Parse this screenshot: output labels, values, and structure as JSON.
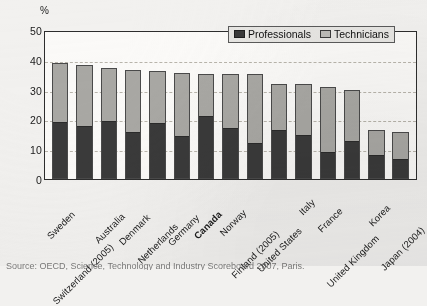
{
  "chart_data": {
    "type": "bar",
    "subtype": "stacked-vertical",
    "title": "",
    "xlabel": "",
    "ylabel": "%",
    "ylim": [
      0,
      50
    ],
    "yticks": [
      0,
      10,
      20,
      30,
      40,
      50
    ],
    "grid": "horizontal-dashed",
    "legend_position": "top-right",
    "categories": [
      "Sweden",
      "Switzerland (2005)",
      "Australia",
      "Denmark",
      "Netherlands",
      "Germany",
      "Canada",
      "Norway",
      "Finland (2005)",
      "United States",
      "Italy",
      "France",
      "United Kingdom",
      "Korea",
      "Japan (2004)"
    ],
    "highlighted_category": "Canada",
    "series": [
      {
        "name": "Professionals",
        "color": "#3a3a3a",
        "values": [
          19.3,
          17.8,
          19.5,
          15.7,
          18.9,
          14.5,
          21.3,
          17.0,
          11.9,
          16.6,
          14.8,
          8.9,
          12.8,
          8.0,
          6.5
        ]
      },
      {
        "name": "Technicians",
        "color": "#a9a8a4",
        "values": [
          19.5,
          20.4,
          17.9,
          20.9,
          17.2,
          21.0,
          14.1,
          18.4,
          23.5,
          15.3,
          17.1,
          21.9,
          17.2,
          8.3,
          9.3
        ]
      }
    ],
    "totals": [
      38.8,
      38.2,
      37.4,
      36.6,
      36.1,
      35.5,
      35.4,
      35.4,
      35.4,
      31.9,
      31.9,
      30.8,
      30.0,
      16.3,
      15.8
    ]
  },
  "axis": {
    "unit_label": "%",
    "ticks": [
      "50",
      "40",
      "30",
      "20",
      "10",
      "0"
    ]
  },
  "legend": {
    "items": [
      {
        "label": "Professionals",
        "swatch": "filled-dark-square-icon"
      },
      {
        "label": "Technicians",
        "swatch": "outlined-light-square-icon"
      }
    ]
  },
  "source": {
    "text": "Source:  OECD, Science, Technology and Industry Scoreboard 2007, Paris."
  }
}
